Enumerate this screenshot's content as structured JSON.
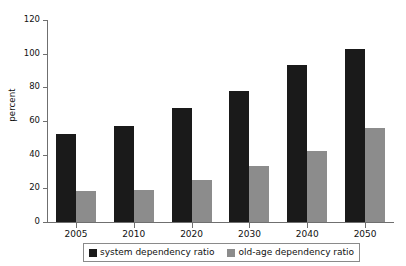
{
  "chart_data": {
    "type": "bar",
    "title": "",
    "xlabel": "",
    "ylabel": "percent",
    "categories": [
      "2005",
      "2010",
      "2020",
      "2030",
      "2040",
      "2050"
    ],
    "series": [
      {
        "name": "system dependency ratio",
        "color": "#1a1a1a",
        "values": [
          52,
          57,
          68,
          78,
          93,
          103
        ]
      },
      {
        "name": "old-age dependency ratio",
        "color": "#8c8c8c",
        "values": [
          18.5,
          19,
          25,
          33,
          42,
          56
        ]
      }
    ],
    "ylim": [
      0,
      120
    ],
    "yticks": [
      0,
      20,
      40,
      60,
      80,
      100,
      120
    ],
    "ytick_labels": [
      "0",
      "20",
      "40",
      "60",
      "80",
      "100",
      "120"
    ],
    "grid": false,
    "legend_position": "bottom"
  },
  "axes": {
    "y_label": "percent"
  },
  "legend": {
    "entries": [
      {
        "label": "system dependency ratio",
        "color": "#1a1a1a"
      },
      {
        "label": "old-age dependency ratio",
        "color": "#8c8c8c"
      }
    ]
  }
}
